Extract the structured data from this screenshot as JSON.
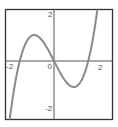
{
  "chart_data": {
    "type": "line",
    "title": "",
    "xlabel": "",
    "ylabel": "",
    "xlim": [
      -2.05,
      2.05
    ],
    "ylim": [
      -2.4,
      2.1
    ],
    "grid": false,
    "legend": null,
    "x_ticks": [
      "-2",
      "0",
      "2"
    ],
    "y_ticks": [
      "2",
      "-2"
    ],
    "series": [
      {
        "name": "f(x)",
        "color": "#888888",
        "note": "estimated cubic with zeros near x=-0.72, 0, 0.72; local max ~(-0.42, 1.1), local min ~(0.42, -1.1); exact formula unknown",
        "x": [
          -1.85,
          -1.5,
          -1.2,
          -0.9,
          -0.72,
          -0.55,
          -0.42,
          -0.25,
          0,
          0.25,
          0.42,
          0.55,
          0.72,
          0.85,
          0.95,
          1.1,
          1.25,
          1.45,
          1.65,
          1.75,
          1.85
        ],
        "y": [
          -2.4,
          -1.6,
          -0.9,
          -0.3,
          0,
          0.75,
          1.1,
          0.8,
          0,
          -0.8,
          -1.1,
          -0.85,
          0,
          0.6,
          1.0,
          1.45,
          1.9,
          2.1,
          2.1,
          2.1,
          2.1
        ]
      }
    ]
  },
  "labels": {
    "x_neg": "-2",
    "x_zero": "0",
    "x_pos": "2",
    "y_pos": "2",
    "y_neg": "-2"
  },
  "colors": {
    "frame": "#333333",
    "axis": "#555555",
    "curve": "#8a8a8a"
  }
}
